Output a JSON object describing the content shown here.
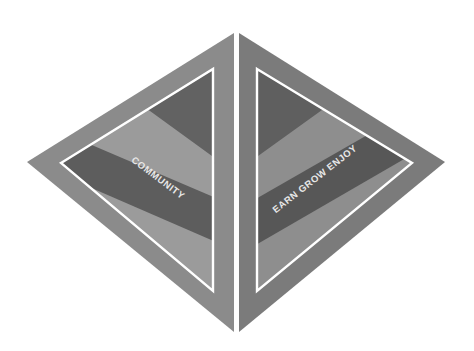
{
  "diagram": {
    "title": "",
    "layout": "diamond split into two mirrored triangles",
    "colors": {
      "background": "#ffffff",
      "left_outer": "#8b8b8b",
      "right_outer": "#7b7b7b",
      "inner_light": "#9b9b9b",
      "inner_light_right": "#8e8e8e",
      "dark_band": "#5d5d5d",
      "dark_region": "#626262",
      "divider_stroke": "#ffffff",
      "label_text": "#e8e8e8"
    },
    "left_triangle": {
      "label": "COMMUNITY"
    },
    "right_triangle": {
      "label": "EARN GROW ENJOY"
    }
  }
}
